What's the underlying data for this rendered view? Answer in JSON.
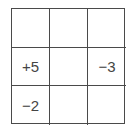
{
  "grid": {
    "rows": 3,
    "cols": 3,
    "cells": [
      [
        "",
        "",
        ""
      ],
      [
        "+5",
        "",
        "−3"
      ],
      [
        "−2",
        "",
        ""
      ]
    ]
  }
}
